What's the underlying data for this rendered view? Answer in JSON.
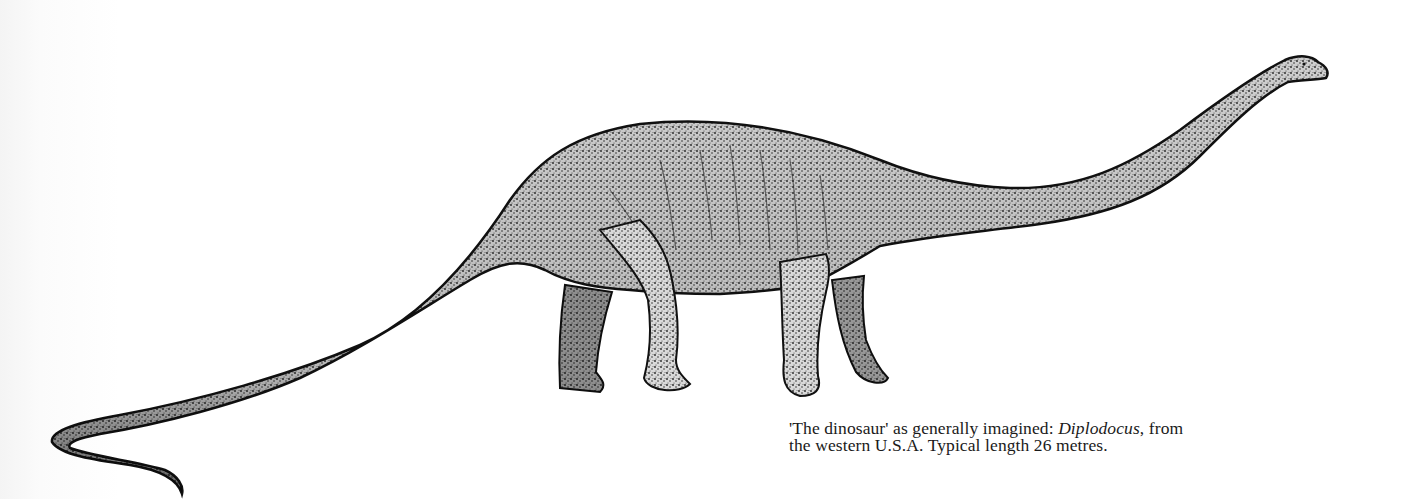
{
  "figure": {
    "subject": "Diplodocus",
    "illustration": {
      "description": "Stippled pen-and-ink side-view drawing of a long-necked, long-tailed sauropod dinosaur facing right",
      "ink_color": "#111111",
      "paper_color": "#ffffff"
    },
    "caption": {
      "line1_pre": "'The dinosaur' as generally imagined: ",
      "line1_italic": "Diplodocus",
      "line1_post": ", from",
      "line2": "the western U.S.A. Typical length 26 metres."
    }
  }
}
